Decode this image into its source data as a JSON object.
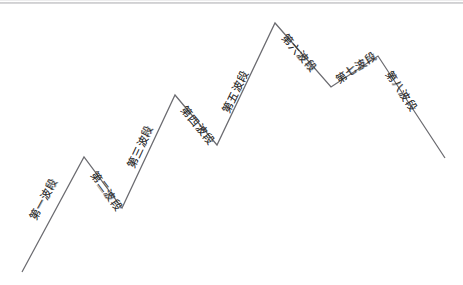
{
  "figure": {
    "title": "",
    "background_color": "#ffffff",
    "line_color": "#6b6b70",
    "label_color": "#2b2b2b",
    "width": 463,
    "height": 285
  },
  "chart_data": {
    "type": "line",
    "title": "",
    "xlabel": "",
    "ylabel": "",
    "grid": false,
    "legend": "none",
    "x": [
      22,
      84,
      122,
      175,
      217,
      275,
      331,
      378,
      445
    ],
    "y": [
      272,
      157,
      208,
      95,
      145,
      23,
      87,
      56,
      158
    ],
    "points": [
      {
        "x": 22,
        "y": 272,
        "role": "start"
      },
      {
        "x": 84,
        "y": 157,
        "role": "peak"
      },
      {
        "x": 122,
        "y": 208,
        "role": "valley"
      },
      {
        "x": 175,
        "y": 95,
        "role": "peak"
      },
      {
        "x": 217,
        "y": 145,
        "role": "valley"
      },
      {
        "x": 275,
        "y": 23,
        "role": "peak"
      },
      {
        "x": 331,
        "y": 87,
        "role": "valley"
      },
      {
        "x": 378,
        "y": 56,
        "role": "peak"
      },
      {
        "x": 445,
        "y": 158,
        "role": "end"
      }
    ],
    "segments": [
      {
        "index": 1,
        "label": "第一波段",
        "direction": "up",
        "from": 0,
        "to": 1
      },
      {
        "index": 2,
        "label": "第二波段",
        "direction": "down",
        "from": 1,
        "to": 2
      },
      {
        "index": 3,
        "label": "第三波段",
        "direction": "up",
        "from": 2,
        "to": 3
      },
      {
        "index": 4,
        "label": "第四波段",
        "direction": "down",
        "from": 3,
        "to": 4
      },
      {
        "index": 5,
        "label": "第五波段",
        "direction": "up",
        "from": 4,
        "to": 5
      },
      {
        "index": 6,
        "label": "第六波段",
        "direction": "down",
        "from": 5,
        "to": 6
      },
      {
        "index": 7,
        "label": "第七波段",
        "direction": "up",
        "from": 6,
        "to": 7
      },
      {
        "index": 8,
        "label": "第八波段",
        "direction": "down",
        "from": 7,
        "to": 8
      }
    ],
    "series": [
      {
        "name": "wave-path",
        "values": [
          272,
          157,
          208,
          95,
          145,
          23,
          87,
          56,
          158
        ]
      }
    ]
  },
  "labels": {
    "segment_1": "第一波段",
    "segment_2": "第二波段",
    "segment_3": "第三波段",
    "segment_4": "第四波段",
    "segment_5": "第五波段",
    "segment_6": "第六波段",
    "segment_7": "第七波段",
    "segment_8": "第八波段"
  }
}
